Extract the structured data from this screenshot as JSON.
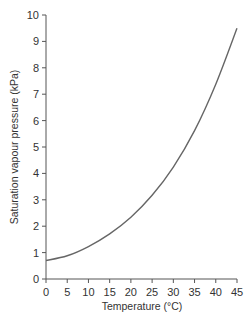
{
  "chart_data": {
    "type": "line",
    "title": "",
    "xlabel": "Temperature (°C)",
    "ylabel": "Saturation vapour pressure (kPa)",
    "xlim": [
      0,
      45
    ],
    "ylim": [
      0,
      10
    ],
    "xticks": [
      0,
      5,
      10,
      15,
      20,
      25,
      30,
      35,
      40,
      45
    ],
    "yticks": [
      0,
      1,
      2,
      3,
      4,
      5,
      6,
      7,
      8,
      9,
      10
    ],
    "grid": false,
    "legend": null,
    "series": [
      {
        "name": "Saturation vapour pressure",
        "x": [
          0,
          5,
          10,
          15,
          20,
          25,
          30,
          35,
          40,
          45
        ],
        "y": [
          0.7,
          0.88,
          1.23,
          1.71,
          2.34,
          3.17,
          4.24,
          5.62,
          7.38,
          9.5
        ]
      }
    ],
    "line_color": "#666666"
  }
}
